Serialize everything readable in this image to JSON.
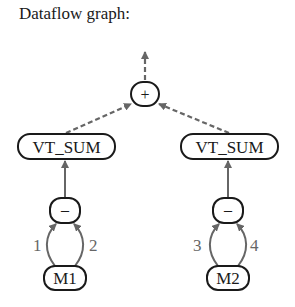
{
  "title": "Dataflow graph:",
  "nodes": {
    "plus": {
      "label": "+"
    },
    "vt_sum_left": {
      "label": "VT_SUM"
    },
    "vt_sum_right": {
      "label": "VT_SUM"
    },
    "minus_left": {
      "label": "–"
    },
    "minus_right": {
      "label": "–"
    },
    "m1": {
      "label": "M1"
    },
    "m2": {
      "label": "M2"
    }
  },
  "edge_labels": {
    "e1": "1",
    "e2": "2",
    "e3": "3",
    "e4": "4"
  },
  "colors": {
    "node_stroke": "#1a1a1a",
    "edge": "#666666"
  }
}
